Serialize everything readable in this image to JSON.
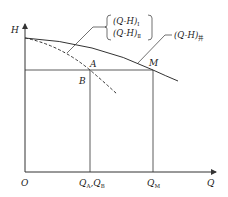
{
  "diagram": {
    "axes": {
      "y_label": "H",
      "x_label": "Q",
      "origin_label": "O"
    },
    "points": {
      "A": "A",
      "B": "B",
      "M": "M"
    },
    "x_ticks": {
      "qa_main": "Q",
      "qa_sub": "A",
      "qb_sep": ",Q",
      "qb_sub": "B",
      "qm_main": "Q",
      "qm_sub": "M"
    },
    "legend": {
      "curve_1_main": "(Q-H)",
      "curve_1_sub": "Ⅰ",
      "curve_2_main": "(Q-H)",
      "curve_2_sub": "Ⅱ",
      "combined_main": "(Q-H)",
      "combined_sub": "并"
    },
    "colors": {
      "line": "#333333",
      "background": "#ffffff"
    }
  }
}
